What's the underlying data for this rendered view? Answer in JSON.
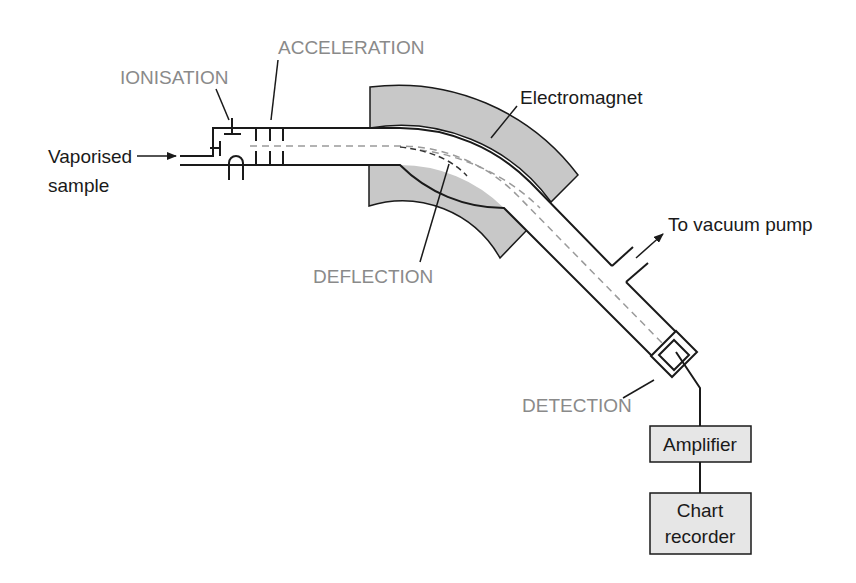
{
  "diagram": {
    "stages": {
      "ionisation": "IONISATION",
      "acceleration": "ACCELERATION",
      "deflection": "DEFLECTION",
      "detection": "DETECTION"
    },
    "parts": {
      "inlet_line1": "Vaporised",
      "inlet_line2": "sample",
      "electromagnet": "Electromagnet",
      "vacuum_pump": "To vacuum pump",
      "amplifier": "Amplifier",
      "recorder_line1": "Chart",
      "recorder_line2": "recorder"
    },
    "colors": {
      "stage_label": "#8a8a8a",
      "outline": "#1a1a1a",
      "magnet_fill": "#c8c8c8",
      "box_fill": "#e6e6e6",
      "ion_path": "#9a9a9a",
      "ion_path_dark": "#333333"
    }
  }
}
